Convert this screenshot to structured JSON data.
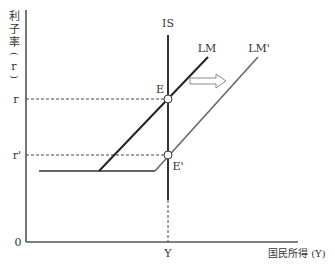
{
  "diagram": {
    "y_axis_label_chars": [
      "利",
      "子",
      "率",
      "(",
      "r",
      ")"
    ],
    "x_axis_label": "国民所得 (Y)",
    "origin_label": "0",
    "r_label": "r",
    "r_prime_label": "r'",
    "y_label": "Y",
    "is_label": "IS",
    "lm_label": "LM",
    "lm_prime_label": "LM'",
    "e_label": "E",
    "e_prime_label": "E'",
    "colors": {
      "axis": "#555555",
      "is_line": "#333333",
      "lm_line": "#222222",
      "lm_prime_line": "#666666",
      "dashed": "#444444",
      "arrow": "#888888"
    }
  }
}
